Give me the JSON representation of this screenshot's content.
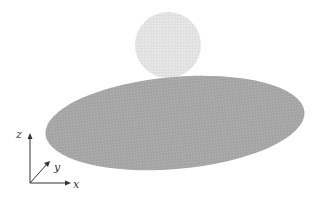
{
  "figure": {
    "objects": [
      {
        "name": "disk",
        "shape": "ellipse",
        "color": "#a9a9a9"
      },
      {
        "name": "sphere",
        "shape": "circle",
        "color": "#e2e2e2"
      }
    ],
    "axes": {
      "x_label": "x",
      "y_label": "y",
      "z_label": "z",
      "color": "#333333"
    }
  }
}
